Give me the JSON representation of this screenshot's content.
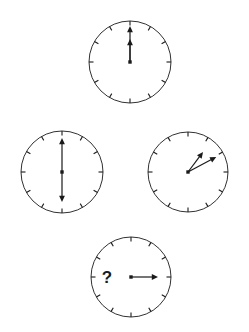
{
  "figure": {
    "background_color": "#ffffff",
    "stroke_color": "#1a1a1a",
    "width": 249,
    "height": 332,
    "question_mark": "?"
  },
  "chart_data": {
    "type": "diagram",
    "layout": "diamond",
    "clock_radius": 41,
    "tick_count": 12,
    "clocks": [
      {
        "id": "clock-top",
        "position": "top",
        "center": {
          "x": 130,
          "y": 62
        },
        "radius": 41,
        "question_mark": false,
        "reading": "12:00",
        "hands": [
          {
            "name": "minute-hand",
            "points_to_hour": 12,
            "angle_deg": 0,
            "length": 36,
            "arrow": true
          },
          {
            "name": "hour-hand",
            "points_to_hour": 12,
            "angle_deg": 0,
            "length": 23,
            "arrow": true
          }
        ]
      },
      {
        "id": "clock-left",
        "position": "left",
        "center": {
          "x": 62,
          "y": 172
        },
        "radius": 41,
        "question_mark": false,
        "reading": "6:00",
        "hands": [
          {
            "name": "minute-hand",
            "points_to_hour": 12,
            "angle_deg": 0,
            "length": 34,
            "arrow": true
          },
          {
            "name": "hour-hand",
            "points_to_hour": 6,
            "angle_deg": 180,
            "length": 30,
            "arrow": true
          }
        ]
      },
      {
        "id": "clock-right",
        "position": "right",
        "center": {
          "x": 188,
          "y": 172
        },
        "radius": 40,
        "question_mark": false,
        "reading": "1:10",
        "hands": [
          {
            "name": "minute-hand",
            "points_to_hour": 2,
            "angle_deg": 62,
            "length": 32,
            "arrow": true
          },
          {
            "name": "hour-hand",
            "points_to_hour": 1,
            "angle_deg": 37,
            "length": 25,
            "arrow": true
          }
        ]
      },
      {
        "id": "clock-bottom",
        "position": "bottom",
        "center": {
          "x": 131,
          "y": 277
        },
        "radius": 40,
        "question_mark": true,
        "question_mark_offset": {
          "x": -24,
          "y": 0
        },
        "reading": "?",
        "hands": [
          {
            "name": "minute-hand",
            "points_to_hour": 3,
            "angle_deg": 90,
            "length": 27,
            "arrow": true
          }
        ]
      }
    ]
  }
}
